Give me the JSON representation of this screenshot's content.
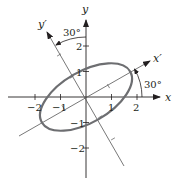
{
  "diagram": {
    "origin_px": [
      86,
      97
    ],
    "unit_px": 25.5,
    "rotation_deg": 30,
    "colors": {
      "axis": "#231f20",
      "rotated_axis": "#555555",
      "ellipse": "#6d6e71",
      "text": "#231f20"
    },
    "axes": {
      "x_label": "x",
      "y_label": "y",
      "x_prime_label": "x′",
      "y_prime_label": "y′"
    },
    "x_ticks": [
      {
        "value": -2,
        "label": "−2"
      },
      {
        "value": -1,
        "label": "−1"
      },
      {
        "value": 1,
        "label": "1"
      },
      {
        "value": 2,
        "label": "2"
      }
    ],
    "y_ticks": [
      {
        "value": 2,
        "label": "2"
      },
      {
        "value": 1,
        "label": "1"
      },
      {
        "value": -1,
        "label": "−1"
      },
      {
        "value": -2,
        "label": "−2"
      }
    ],
    "angle_labels": {
      "x_to_x_prime": "30°",
      "y_to_y_prime": "30°"
    },
    "ellipse": {
      "center": [
        0,
        0
      ],
      "semi_major": 2,
      "semi_minor": 1,
      "rotation_deg": 30
    }
  }
}
